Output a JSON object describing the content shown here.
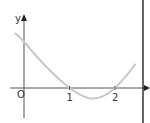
{
  "chart_data": {
    "type": "line",
    "title": "",
    "xlabel": "x",
    "ylabel": "y",
    "origin_label": "O",
    "x_ticks": [
      {
        "value": 1,
        "label": "1"
      },
      {
        "value": 2,
        "label": "2"
      }
    ],
    "xlim": [
      -0.3,
      2.8
    ],
    "ylim": [
      -0.6,
      1.6
    ],
    "grid": false,
    "series": [
      {
        "name": "curve",
        "color": "#c8c8c8",
        "points": [
          [
            -0.2,
            1.25
          ],
          [
            0,
            1.05
          ],
          [
            0.25,
            0.75
          ],
          [
            0.5,
            0.47
          ],
          [
            0.75,
            0.22
          ],
          [
            1,
            0
          ],
          [
            1.25,
            -0.16
          ],
          [
            1.5,
            -0.24
          ],
          [
            1.75,
            -0.18
          ],
          [
            2,
            0
          ],
          [
            2.25,
            0.28
          ],
          [
            2.45,
            0.55
          ]
        ]
      }
    ]
  },
  "colors": {
    "axis": "#555555",
    "border_line": "#111111"
  }
}
